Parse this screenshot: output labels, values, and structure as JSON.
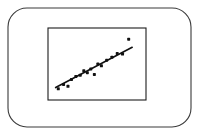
{
  "figure": {
    "background_color": "#ffffff",
    "outer_frame": {
      "name": "rounded-bezel",
      "x": 8,
      "y": 8,
      "width": 183,
      "height": 119,
      "corner_radius": 19,
      "stroke_color": "#3a3a3a",
      "stroke_width": 1.1,
      "fill": "none"
    },
    "inner_frame": {
      "name": "plot-border",
      "x": 48,
      "y": 28,
      "width": 98,
      "height": 72,
      "stroke_color": "#1c1c1c",
      "stroke_width": 1.1,
      "fill": "#ffffff"
    }
  },
  "chart_data": {
    "type": "scatter",
    "title": "",
    "subtitle": "",
    "xlabel": "",
    "ylabel": "",
    "grid": false,
    "legend": false,
    "legend_position": "none",
    "axis_ticks": false,
    "tick_labels": [],
    "annotations": [],
    "xlim": [
      0,
      100
    ],
    "ylim": [
      0,
      100
    ],
    "point_color": "#111111",
    "point_radius": 1.5,
    "point_shape": "square-dot",
    "x": [
      6,
      12,
      17,
      21,
      26,
      31,
      35,
      39,
      43,
      47,
      51,
      55,
      61,
      67,
      73,
      79,
      86
    ],
    "y": [
      10,
      17,
      14,
      25,
      30,
      32,
      39,
      36,
      42,
      33,
      50,
      47,
      56,
      61,
      67,
      66,
      90
    ],
    "series": [
      {
        "name": "observations",
        "color": "#111111",
        "points": [
          {
            "x": 6,
            "y": 10
          },
          {
            "x": 12,
            "y": 17
          },
          {
            "x": 17,
            "y": 14
          },
          {
            "x": 21,
            "y": 25
          },
          {
            "x": 26,
            "y": 30
          },
          {
            "x": 31,
            "y": 32
          },
          {
            "x": 35,
            "y": 39
          },
          {
            "x": 39,
            "y": 36
          },
          {
            "x": 43,
            "y": 42
          },
          {
            "x": 47,
            "y": 33
          },
          {
            "x": 51,
            "y": 50
          },
          {
            "x": 55,
            "y": 47
          },
          {
            "x": 61,
            "y": 56
          },
          {
            "x": 67,
            "y": 61
          },
          {
            "x": 73,
            "y": 67
          },
          {
            "x": 79,
            "y": 66
          },
          {
            "x": 86,
            "y": 90
          }
        ]
      }
    ],
    "trend_line": {
      "name": "regression-line",
      "color": "#111111",
      "width": 1.6,
      "x_start": 3,
      "y_start": 12,
      "x_end": 90,
      "y_end": 77
    }
  }
}
